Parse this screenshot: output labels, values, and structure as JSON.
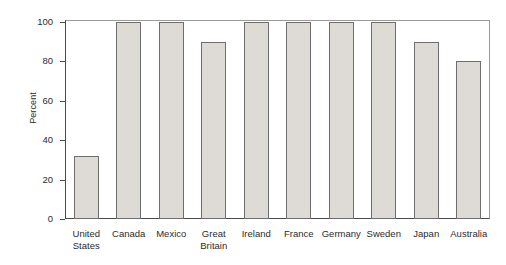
{
  "chart_data": {
    "type": "bar",
    "title": "",
    "xlabel": "",
    "ylabel": "Percent",
    "ylim": [
      0,
      100
    ],
    "yticks": [
      0,
      20,
      40,
      60,
      80,
      100
    ],
    "ytick_labels": [
      "0",
      "20",
      "40",
      "60",
      "80",
      "100"
    ],
    "grid": false,
    "legend": null,
    "categories": [
      "United States",
      "Canada",
      "Mexico",
      "Great Britain",
      "Ireland",
      "France",
      "Germany",
      "Sweden",
      "Japan",
      "Australia"
    ],
    "category_labels": [
      "United\nStates",
      "Canada",
      "Mexico",
      "Great\nBritain",
      "Ireland",
      "France",
      "Germany",
      "Sweden",
      "Japan",
      "Australia"
    ],
    "values": [
      32,
      100,
      100,
      90,
      100,
      100,
      100,
      100,
      90,
      80
    ],
    "bar_fill_color": "#dedbd7",
    "bar_edge_color": "#6e6e6e",
    "axis_color": "#4a4a4a",
    "background_color": "#ffffff"
  }
}
